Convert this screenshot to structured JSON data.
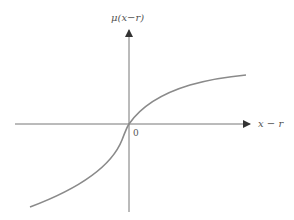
{
  "diagram": {
    "y_axis_label": "μ(x−r)",
    "x_axis_label": "x − r",
    "origin_label": "0",
    "colors": {
      "axis": "#777777",
      "curve": "#8a8a8a",
      "text": "#555555"
    }
  }
}
